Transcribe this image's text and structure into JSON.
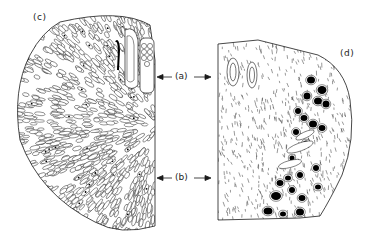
{
  "figure": {
    "panels": [
      {
        "id": "c",
        "label": "(c)",
        "x": 36,
        "y": 18
      },
      {
        "id": "d",
        "label": "(d)",
        "x": 342,
        "y": 55
      }
    ],
    "annotations": [
      {
        "id": "a",
        "label": "(a)",
        "x": 180,
        "y": 78
      },
      {
        "id": "b",
        "label": "(b)",
        "x": 180,
        "y": 180
      }
    ]
  },
  "colors": {
    "ink": "#1a1a1a",
    "paper": "#ffffff",
    "nucleus": "#000000"
  }
}
